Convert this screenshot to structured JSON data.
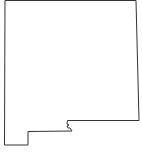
{
  "map": {
    "subject": "New Mexico state outline",
    "stroke_color": "#333333",
    "fill_color": "#ffffff",
    "background": "#ffffff"
  }
}
